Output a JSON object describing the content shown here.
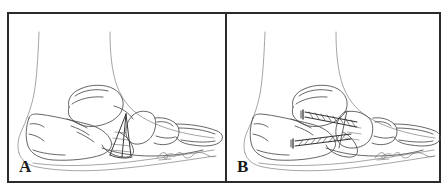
{
  "figure": {
    "kind": "medical-line-illustration",
    "background_color": "#ffffff",
    "frame_color": "#2b2b2b",
    "ink_color": "#3a3a3a",
    "light_ink_color": "#9a9a9a",
    "panels": [
      {
        "label": "A",
        "name": "panel-a",
        "caption_text": "",
        "content_description": "Lateral view of foot skeleton with soft-tissue outline of the leg; a wedge-shaped osteotomy is outlined at the midfoot with dashed guide lines marking the planned bone cut",
        "signature": "artist signature"
      },
      {
        "label": "B",
        "name": "panel-b",
        "caption_text": "",
        "content_description": "Same lateral view after correction, with the wedge closed and two threaded screws placed across the fusion site for internal fixation",
        "signature": "artist signature"
      }
    ]
  }
}
